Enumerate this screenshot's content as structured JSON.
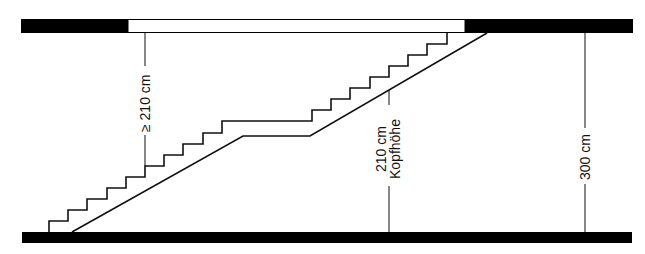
{
  "diagram": {
    "type": "stair-section",
    "colors": {
      "slab": "#000000",
      "line": "#111111",
      "background": "#ffffff"
    },
    "labels": {
      "min_headroom": "≥ 210 cm",
      "headroom_value": "210 cm",
      "headroom_term": "Kopfhöhe",
      "floor_height": "300 cm"
    }
  }
}
